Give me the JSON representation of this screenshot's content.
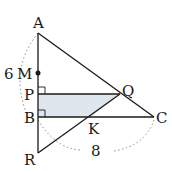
{
  "diagram": {
    "type": "geometry",
    "colors": {
      "line": "#1a1a1a",
      "shade": "#dfe6ee",
      "dotted": "#888888"
    },
    "points": {
      "A": {
        "label": "A",
        "x": 38,
        "y": 33
      },
      "M": {
        "label": "M",
        "x": 38,
        "y": 73
      },
      "P": {
        "label": "P",
        "x": 38,
        "y": 94
      },
      "B": {
        "label": "B",
        "x": 38,
        "y": 117
      },
      "R": {
        "label": "R",
        "x": 38,
        "y": 153
      },
      "Q": {
        "label": "Q",
        "x": 120,
        "y": 94
      },
      "K": {
        "label": "K",
        "x": 91,
        "y": 117
      },
      "C": {
        "label": "C",
        "x": 154,
        "y": 117
      }
    },
    "measurements": {
      "AB": "6",
      "BC": "8"
    },
    "labels": {
      "A": "A",
      "M": "M",
      "P": "P",
      "B": "B",
      "R": "R",
      "Q": "Q",
      "K": "K",
      "C": "C",
      "six": "6",
      "eight": "8"
    }
  }
}
